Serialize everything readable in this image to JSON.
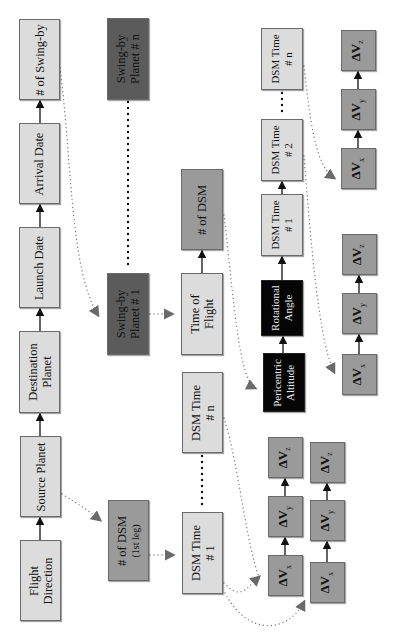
{
  "diagram": {
    "orientation": "rotated-90-ccw",
    "colors": {
      "light_box": "#dcdcdc",
      "mid_box": "#9a9a9a",
      "dark_box": "#5b5b5b",
      "black_box": "#050505",
      "connector": "#333333",
      "dotted": "#777777"
    },
    "main_chain": [
      {
        "id": "flight-direction",
        "lines": [
          "Flight",
          "Direction"
        ]
      },
      {
        "id": "source-planet",
        "lines": [
          "Source Planet"
        ]
      },
      {
        "id": "destination-planet",
        "lines": [
          "Destination",
          "Planet"
        ]
      },
      {
        "id": "launch-date",
        "lines": [
          "Launch Date"
        ]
      },
      {
        "id": "arrival-date",
        "lines": [
          "Arrival Date"
        ]
      },
      {
        "id": "num-swingby",
        "lines": [
          "# of Swing-by"
        ]
      }
    ],
    "swingby": {
      "planet_1": {
        "lines": [
          "Swing-by",
          "Planet # 1"
        ]
      },
      "planet_n": {
        "lines": [
          "Swing-by",
          "Planet # n"
        ]
      }
    },
    "first_leg": {
      "num_dsm": {
        "line1": "# of DSM",
        "line2": "(1st leg)"
      },
      "dsm_time_1": {
        "lines": [
          "DSM Time",
          "# 1"
        ]
      },
      "dsm_time_n": {
        "lines": [
          "DSM Time",
          "# n"
        ]
      }
    },
    "swingby_leg": {
      "time_of_flight": {
        "lines": [
          "Time of",
          "Flight"
        ]
      },
      "num_dsm": {
        "lines": [
          "# of DSM"
        ]
      },
      "pericentric_altitude": {
        "lines": [
          "Pericentric",
          "Altitude"
        ]
      },
      "rotational_angle": {
        "lines": [
          "Rotational",
          "Angle"
        ]
      },
      "dsm_time_1": {
        "lines": [
          "DSM Time",
          "# 1"
        ]
      },
      "dsm_time_2": {
        "lines": [
          "DSM Time",
          "# 2"
        ]
      },
      "dsm_time_n": {
        "lines": [
          "DSM Time",
          "# n"
        ]
      }
    },
    "delta_v": {
      "symbol": "ΔV",
      "x": "x",
      "y": "y",
      "z": "z"
    }
  }
}
